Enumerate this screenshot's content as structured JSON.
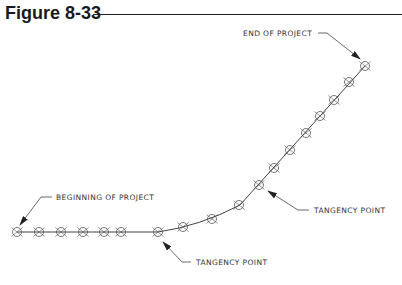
{
  "figure": {
    "title": "Figure 8-33"
  },
  "diagram": {
    "type": "road alignment plan (tangent - curve - tangent)",
    "colors": {
      "line": "#444444",
      "marker": "#555555",
      "text": "#333333"
    },
    "labels": {
      "end": "END OF PROJECT",
      "beginning": "BEGINNING OF PROJECT",
      "tangency_upper": "TANGENCY POINT",
      "tangency_lower": "TANGENCY POINT"
    },
    "station_markers": [
      {
        "x": 17,
        "y": 232
      },
      {
        "x": 39,
        "y": 232
      },
      {
        "x": 61,
        "y": 232
      },
      {
        "x": 83,
        "y": 232
      },
      {
        "x": 104,
        "y": 232
      },
      {
        "x": 121,
        "y": 232
      },
      {
        "x": 158,
        "y": 232
      },
      {
        "x": 183,
        "y": 227
      },
      {
        "x": 212,
        "y": 219
      },
      {
        "x": 239,
        "y": 205
      },
      {
        "x": 259,
        "y": 185
      },
      {
        "x": 274,
        "y": 168
      },
      {
        "x": 290,
        "y": 150
      },
      {
        "x": 306,
        "y": 133
      },
      {
        "x": 320,
        "y": 116
      },
      {
        "x": 334,
        "y": 100
      },
      {
        "x": 349,
        "y": 82
      },
      {
        "x": 365,
        "y": 66
      }
    ]
  }
}
